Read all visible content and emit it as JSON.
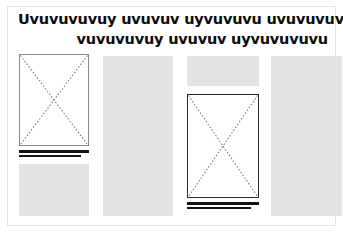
{
  "document": {
    "type": "page-layout-wireframe",
    "canvas": {
      "width": 343,
      "height": 234
    },
    "background_color": "#ffffff",
    "frame_color": "#e2e2e2"
  },
  "headline": {
    "line_1": "Uvuvuvuvuy uvuvuv uyvuvuvu uvuvuvuvu",
    "line_2": "vuvuvuvuy uvuvuv uyvuvuvuvu",
    "color": "#0b0b0b",
    "align_line_1": "left",
    "align_line_2": "right"
  },
  "palette": {
    "text_block_gray": "#e3e3e3",
    "rule_black": "#111111",
    "placeholder_border_thin": "#8c8c8c",
    "placeholder_border_heavy": "#2b2b2b",
    "x_stroke_gray": "#7a7a7a"
  },
  "columns": [
    {
      "id": "column-1",
      "blocks": [
        {
          "kind": "image-placeholder",
          "border": "thin",
          "top": 0,
          "height": 92
        },
        {
          "kind": "caption-rules",
          "top": 96,
          "rules": [
            "long",
            "short"
          ]
        },
        {
          "kind": "text-block",
          "top": 110,
          "height": 52
        }
      ]
    },
    {
      "id": "column-2",
      "blocks": [
        {
          "kind": "text-block",
          "top": 2,
          "height": 160
        }
      ]
    },
    {
      "id": "column-3",
      "blocks": [
        {
          "kind": "text-block",
          "top": 2,
          "height": 30
        },
        {
          "kind": "image-placeholder",
          "border": "heavy",
          "top": 40,
          "height": 104
        },
        {
          "kind": "caption-rules",
          "top": 148,
          "rules": [
            "long",
            "short"
          ]
        }
      ]
    },
    {
      "id": "column-4",
      "blocks": [
        {
          "kind": "text-block",
          "top": 2,
          "height": 160
        }
      ]
    }
  ]
}
